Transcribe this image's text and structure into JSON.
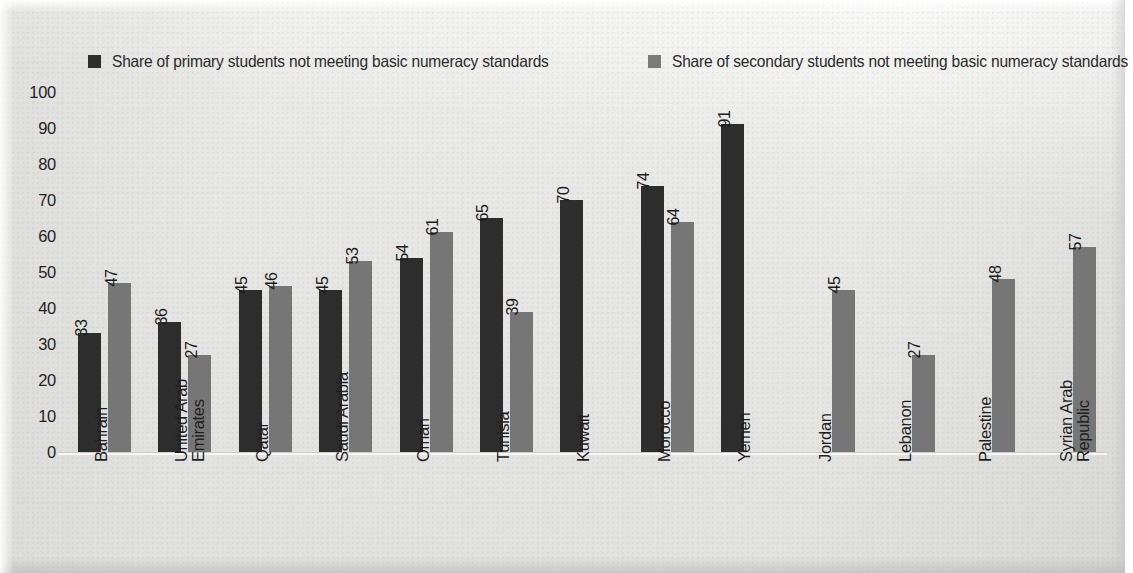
{
  "chart_data": {
    "type": "bar",
    "title": "",
    "subtitle": "",
    "xlabel": "",
    "ylabel": "",
    "ylim": [
      0,
      100
    ],
    "yticks": [
      100,
      90,
      80,
      70,
      60,
      50,
      40,
      30,
      20,
      10,
      0
    ],
    "grid": false,
    "legend_position": "top",
    "orientation": "vertical",
    "categories": [
      "Bahrain",
      "United Arab Emirates",
      "Qatar",
      "Saudi Arabia",
      "Oman",
      "Tunisia",
      "Kuwait",
      "Morocco",
      "Yemen",
      "Jordan",
      "Lebanon",
      "Palestine",
      "Syrian Arab Republic"
    ],
    "category_lines": [
      [
        "Bahrain"
      ],
      [
        "United Arab",
        "Emirates"
      ],
      [
        "Qatar"
      ],
      [
        "Saudi Arabia"
      ],
      [
        "Oman"
      ],
      [
        "Tunisia"
      ],
      [
        "Kuwait"
      ],
      [
        "Morocco"
      ],
      [
        "Yemen"
      ],
      [
        "Jordan"
      ],
      [
        "Lebanon"
      ],
      [
        "Palestine"
      ],
      [
        "Syrian Arab",
        "Republic"
      ]
    ],
    "series": [
      {
        "name": "Share of primary students not meeting basic numeracy standards",
        "key": "primary",
        "color": "#2d2d2d",
        "values": [
          33,
          36,
          45,
          45,
          54,
          65,
          70,
          74,
          91,
          null,
          null,
          null,
          null
        ]
      },
      {
        "name": "Share of secondary students not meeting basic numeracy standards",
        "key": "secondary",
        "color": "#767676",
        "values": [
          47,
          27,
          46,
          53,
          61,
          39,
          null,
          64,
          null,
          45,
          27,
          48,
          57
        ]
      }
    ]
  },
  "legend": {
    "primary_label": "Share of primary students not meeting basic numeracy standards",
    "secondary_label": "Share of secondary students not meeting basic numeracy standards",
    "primary_color": "#2d2d2d",
    "secondary_color": "#767676"
  }
}
